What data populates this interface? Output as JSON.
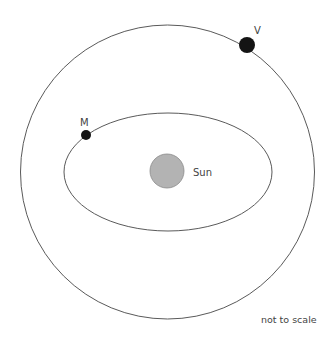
{
  "diagram": {
    "title": "",
    "orbits": {
      "outer": {
        "name": "V orbit",
        "shape": "circle",
        "color": "#5a5a5a"
      },
      "inner": {
        "name": "M orbit",
        "shape": "ellipse",
        "color": "#5a5a5a"
      }
    },
    "bodies": {
      "sun": {
        "label": "Sun",
        "fill": "#b3b3b3",
        "stroke": "#8a8a8a"
      },
      "planet_v": {
        "label": "V",
        "fill": "#141414"
      },
      "planet_m": {
        "label": "M",
        "fill": "#141414"
      }
    },
    "note": "not to scale"
  }
}
